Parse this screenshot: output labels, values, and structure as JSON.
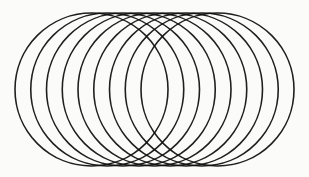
{
  "figure": {
    "canvas": {
      "width": 309,
      "height": 177,
      "background_color": "#fbfbfa"
    },
    "stroke": {
      "color": "#111111",
      "width": 1.6,
      "linecap": "round",
      "opacity": 0.94,
      "style": "solid"
    }
  },
  "chart_data": {
    "type": "scatter",
    "subtitle": "",
    "xlabel": "",
    "ylabel": "",
    "xlim": [
      0,
      309
    ],
    "ylim": [
      0,
      177
    ],
    "grid": false,
    "legend": null,
    "shape": "circle",
    "count": 9,
    "radius": 76.5,
    "center_y": 89.5,
    "spacing_x": 15.75,
    "first_center_x": 91.5,
    "last_center_x": 217.5,
    "bounds": {
      "left": 15.0,
      "right": 294.0,
      "top": 13.0,
      "bottom": 166.0
    },
    "circles": [
      {
        "index": 1,
        "cx": 91.5,
        "cy": 89.5,
        "r": 76.5
      },
      {
        "index": 2,
        "cx": 107.25,
        "cy": 89.5,
        "r": 76.5
      },
      {
        "index": 3,
        "cx": 123.0,
        "cy": 89.5,
        "r": 76.5
      },
      {
        "index": 4,
        "cx": 138.75,
        "cy": 89.5,
        "r": 76.5
      },
      {
        "index": 5,
        "cx": 154.5,
        "cy": 89.5,
        "r": 76.5
      },
      {
        "index": 6,
        "cx": 170.25,
        "cy": 89.5,
        "r": 76.5
      },
      {
        "index": 7,
        "cx": 186.0,
        "cy": 89.5,
        "r": 76.5
      },
      {
        "index": 8,
        "cx": 201.75,
        "cy": 89.5,
        "r": 76.5
      },
      {
        "index": 9,
        "cx": 217.5,
        "cy": 89.5,
        "r": 76.5
      }
    ],
    "annotations": []
  }
}
